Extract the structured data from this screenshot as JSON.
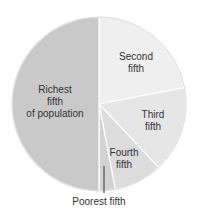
{
  "chart_data": {
    "type": "pie",
    "title": "",
    "start_angle_deg": 0,
    "direction": "clockwise",
    "categories": [
      "Second fifth",
      "Third fifth",
      "Fourth fifth",
      "Poorest fifth",
      "Richest fifth of population"
    ],
    "values": [
      22,
      16,
      9,
      3,
      50
    ],
    "unit": "% of income (estimated from slice angles)",
    "slices": [
      {
        "name": "Second fifth",
        "label_lines": [
          "Second",
          "fifth"
        ],
        "value": 22,
        "color": "#efefef"
      },
      {
        "name": "Third fifth",
        "label_lines": [
          "Third",
          "fifth"
        ],
        "value": 16,
        "color": "#e6e6e6"
      },
      {
        "name": "Fourth fifth",
        "label_lines": [
          "Fourth",
          "fifth"
        ],
        "value": 9,
        "color": "#dcdcdc"
      },
      {
        "name": "Poorest fifth",
        "label_lines": [],
        "value": 3,
        "color": "#d2d2d2"
      },
      {
        "name": "Richest fifth of population",
        "label_lines": [
          "Richest",
          "fifth",
          "of population"
        ],
        "value": 50,
        "color": "#c9c9c9"
      }
    ],
    "annotations": [
      {
        "text": "Poorest fifth",
        "type": "leader-line",
        "target": "Poorest fifth"
      }
    ],
    "legend": "none",
    "grid": false
  },
  "labels": {
    "second": [
      "Second",
      "fifth"
    ],
    "third": [
      "Third",
      "fifth"
    ],
    "fourth": [
      "Fourth",
      "fifth"
    ],
    "richest": [
      "Richest",
      "fifth",
      "of population"
    ],
    "poorest": "Poorest fifth"
  }
}
